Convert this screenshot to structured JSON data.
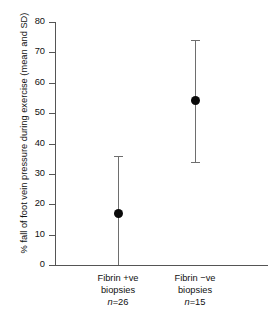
{
  "chart_data": {
    "type": "scatter",
    "title": "",
    "subtitle": "",
    "xlabel": "",
    "ylabel": "% fall of foot vein pressure during exercise (mean and SD)",
    "ylim": [
      0,
      80
    ],
    "yticks": [
      0,
      10,
      20,
      30,
      40,
      50,
      60,
      70,
      80
    ],
    "ytick_labels": [
      "0",
      "10",
      "20",
      "30",
      "40",
      "50",
      "60",
      "70",
      "80"
    ],
    "grid": false,
    "legend": "none",
    "error_style": "mean with SD whiskers",
    "categories": [
      "Fibrin +ve biopsies",
      "Fibrin −ve biopsies"
    ],
    "points": [
      {
        "category": "Fibrin +ve biopsies",
        "line1": "Fibrin +ve",
        "line2": "biopsies",
        "n_prefix": "n",
        "n_value": "=26",
        "n": 26,
        "mean": 17,
        "sd_upper": 36,
        "sd_lower": 0
      },
      {
        "category": "Fibrin −ve biopsies",
        "line1": "Fibrin −ve",
        "line2": "biopsies",
        "n_prefix": "n",
        "n_value": "=15",
        "n": 15,
        "mean": 54,
        "sd_upper": 74,
        "sd_lower": 34
      }
    ],
    "colors": {
      "marker": "#0a0a0a",
      "errorbar": "#6e6e6e",
      "axis": "#555555",
      "text": "#111111",
      "background": "#ffffff"
    }
  }
}
